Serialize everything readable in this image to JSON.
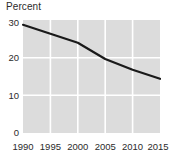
{
  "chart_data": {
    "type": "line",
    "title": "",
    "ylabel": "Percent",
    "xlabel": "",
    "x": [
      1990,
      1995,
      2000,
      2005,
      2010,
      2015
    ],
    "series": [
      {
        "name": "Percent",
        "values": [
          29.5,
          27.0,
          24.5,
          20.0,
          17.0,
          14.5
        ]
      }
    ],
    "x_ticks": [
      "1990",
      "1995",
      "2000",
      "2005",
      "2010",
      "2015"
    ],
    "y_ticks": [
      "0",
      "10",
      "20",
      "30"
    ],
    "y_tick_values": [
      0,
      10,
      20,
      30
    ],
    "xlim": [
      1990,
      2015
    ],
    "ylim": [
      0,
      30
    ],
    "grid": true,
    "legend": "none",
    "plot_background_color": "#dcdcdc",
    "gridline_color": "#ffffff",
    "line_color": "#1a1a1a",
    "text_color": "#2b2b2b"
  }
}
